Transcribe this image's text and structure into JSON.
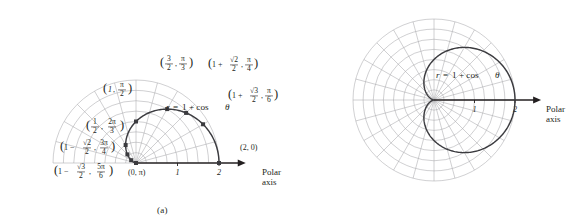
{
  "figure": {
    "equation": "r = 1 + cos θ",
    "equation_parts": {
      "r": "r",
      "eq": "=",
      "rhs": "1 + cos",
      "theta": "θ"
    }
  },
  "panel_a": {
    "caption": "(a)",
    "equation_r": "r",
    "equation_eq": "=",
    "equation_rhs": "1 + cos",
    "equation_theta": "θ",
    "axis_label_line1": "Polar",
    "axis_label_line2": "axis",
    "ticks": [
      {
        "label": "1",
        "value": 1
      },
      {
        "label": "2",
        "value": 2
      }
    ],
    "points": [
      {
        "id": "theta-0",
        "r_label": "2",
        "theta_label": "0",
        "r": 2.0,
        "theta_deg": 0,
        "text": "(2, 0)",
        "anchor": "start"
      },
      {
        "id": "theta-pi6",
        "r_label": "1 + √3/2",
        "theta_label": "π/6",
        "r": 1.866,
        "theta_deg": 30,
        "text": "(1 + √3/2, π/6)",
        "anchor": "start"
      },
      {
        "id": "theta-pi4",
        "r_label": "1 + √2/2",
        "theta_label": "π/4",
        "r": 1.707,
        "theta_deg": 45,
        "text": "(1 + √2/2, π/4)",
        "anchor": "start"
      },
      {
        "id": "theta-pi3",
        "r_label": "3/2",
        "theta_label": "π/3",
        "r": 1.5,
        "theta_deg": 60,
        "text": "(3/2, π/3)",
        "anchor": "middle"
      },
      {
        "id": "theta-pi2",
        "r_label": "1",
        "theta_label": "π/2",
        "r": 1.0,
        "theta_deg": 90,
        "text": "(1, π/2)",
        "anchor": "end"
      },
      {
        "id": "theta-2pi3",
        "r_label": "1/2",
        "theta_label": "2π/3",
        "r": 0.5,
        "theta_deg": 120,
        "text": "(1/2, 2π/3)",
        "anchor": "end"
      },
      {
        "id": "theta-3pi4",
        "r_label": "1 − √2/2",
        "theta_label": "3π/4",
        "r": 0.293,
        "theta_deg": 135,
        "text": "(1 − √2/2, 3π/4)",
        "anchor": "end"
      },
      {
        "id": "theta-5pi6",
        "r_label": "1 − √3/2",
        "theta_label": "5π/6",
        "r": 0.134,
        "theta_deg": 150,
        "text": "(1 − √3/2, 5π/6)",
        "anchor": "end"
      },
      {
        "id": "theta-pi",
        "r_label": "0",
        "theta_label": "π",
        "r": 0.0,
        "theta_deg": 180,
        "text": "(0, π)",
        "anchor": "start"
      }
    ],
    "grid": {
      "rings": 8,
      "max_radius": 2.0,
      "spoke_step_deg": 15,
      "half": true
    }
  },
  "panel_b": {
    "caption": "(b)",
    "equation_r": "r",
    "equation_eq": "=",
    "equation_rhs": "1 + cos",
    "equation_theta": "θ",
    "axis_label_line1": "Polar",
    "axis_label_line2": "axis",
    "ticks": [
      {
        "label": "1",
        "value": 1
      },
      {
        "label": "2",
        "value": 2
      }
    ],
    "grid": {
      "rings": 8,
      "max_radius": 2.0,
      "spoke_step_deg": 15,
      "half": false
    }
  },
  "colors": {
    "grid": "#a9a8ad",
    "curve": "#3b3b3f",
    "axis": "#231f20",
    "text": "#231f20",
    "background": "#ffffff"
  },
  "fractions": {
    "sqrt2_over_2": {
      "num": "√2",
      "den": "2"
    },
    "sqrt3_over_2": {
      "num": "√3",
      "den": "2"
    },
    "three_halves": {
      "num": "3",
      "den": "2"
    },
    "one_half": {
      "num": "1",
      "den": "2"
    },
    "pi_over_2": {
      "num": "π",
      "den": "2"
    },
    "pi_over_3": {
      "num": "π",
      "den": "3"
    },
    "pi_over_4": {
      "num": "π",
      "den": "4"
    },
    "pi_over_6": {
      "num": "π",
      "den": "6"
    },
    "two_pi_over_3": {
      "num": "2π",
      "den": "3"
    },
    "three_pi_over_4": {
      "num": "3π",
      "den": "4"
    },
    "five_pi_over_6": {
      "num": "5π",
      "den": "6"
    }
  }
}
